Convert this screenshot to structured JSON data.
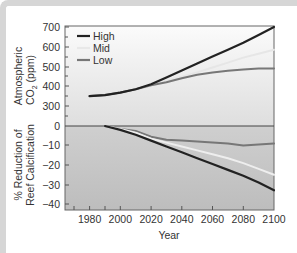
{
  "chart_data": [
    {
      "type": "line",
      "title": "",
      "xlabel": "Year",
      "ylabel": "Atmospheric CO2 (ppm)",
      "ylim": [
        300,
        700
      ],
      "y_axis_break": true,
      "y_ticks": [
        700,
        600,
        500,
        400,
        300,
        0
      ],
      "x_ticks": [
        1980,
        2000,
        2020,
        2040,
        2060,
        2080,
        2100
      ],
      "x": [
        1980,
        1990,
        2000,
        2010,
        2020,
        2030,
        2040,
        2050,
        2060,
        2070,
        2080,
        2090,
        2100
      ],
      "series": [
        {
          "name": "High",
          "color": "#222222",
          "values": [
            350,
            355,
            368,
            385,
            410,
            445,
            480,
            515,
            550,
            585,
            620,
            660,
            700
          ]
        },
        {
          "name": "Mid",
          "color": "#e6e6e6",
          "values": [
            350,
            355,
            368,
            385,
            408,
            428,
            448,
            470,
            495,
            520,
            545,
            565,
            585
          ]
        },
        {
          "name": "Low",
          "color": "#777777",
          "values": [
            350,
            355,
            368,
            385,
            405,
            420,
            440,
            458,
            470,
            478,
            485,
            490,
            490
          ]
        }
      ],
      "legend": {
        "position": "upper-left",
        "entries": [
          "High",
          "Mid",
          "Low"
        ]
      },
      "grid": false
    },
    {
      "type": "line",
      "title": "",
      "xlabel": "Year",
      "ylabel": "% Reduction of Reef Calcification",
      "ylim": [
        -43,
        0
      ],
      "y_ticks": [
        0,
        -10,
        -20,
        -30,
        -40
      ],
      "x_ticks": [
        1980,
        2000,
        2020,
        2040,
        2060,
        2080,
        2100
      ],
      "x": [
        1990,
        2000,
        2010,
        2020,
        2030,
        2040,
        2050,
        2060,
        2070,
        2080,
        2090,
        2100
      ],
      "series": [
        {
          "name": "High",
          "color": "#222222",
          "values": [
            0,
            -2,
            -4.5,
            -7.5,
            -10.5,
            -13.5,
            -16.5,
            -19.5,
            -22.5,
            -25.5,
            -29,
            -33
          ]
        },
        {
          "name": "Mid",
          "color": "#eeeeee",
          "values": [
            0,
            -1.5,
            -3.5,
            -6.5,
            -8.5,
            -10.5,
            -12.5,
            -14.5,
            -16.5,
            -19,
            -22,
            -25
          ]
        },
        {
          "name": "Low",
          "color": "#777777",
          "values": [
            0,
            -1.5,
            -2.5,
            -5.5,
            -7,
            -7.5,
            -8,
            -8.5,
            -9,
            -10,
            -9.5,
            -9
          ]
        }
      ],
      "grid": false
    }
  ],
  "axes": {
    "top_ylabel_line1": "Atmospheric",
    "top_ylabel_line2": "CO",
    "top_ylabel_sub": "2",
    "top_ylabel_unit": " (ppm)",
    "bottom_ylabel_line1": "% Reduction of",
    "bottom_ylabel_line2": "Reef Calcification",
    "xlabel": "Year",
    "top_ticks": [
      "700",
      "600",
      "500",
      "400",
      "300",
      "0"
    ],
    "bottom_ticks": [
      "−10",
      "−20",
      "−30",
      "−40"
    ],
    "x_ticks": [
      "1980",
      "2000",
      "2020",
      "2040",
      "2060",
      "2080",
      "2100"
    ]
  },
  "legend": {
    "high": "High",
    "mid": "Mid",
    "low": "Low"
  },
  "colors": {
    "high": "#222222",
    "mid": "#e8e8e8",
    "low": "#777777",
    "zero_line": "#444444"
  }
}
